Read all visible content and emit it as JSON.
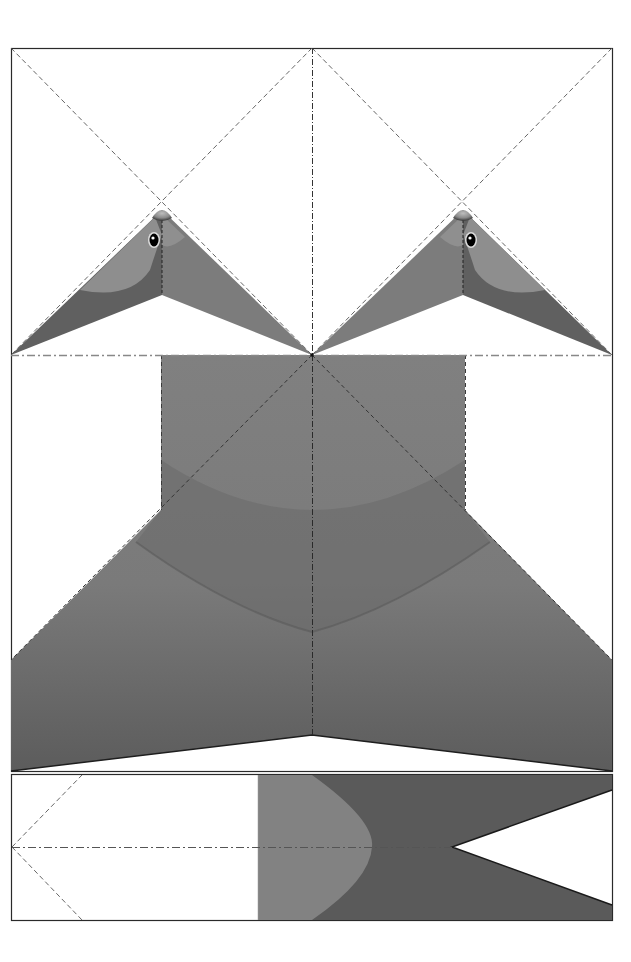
{
  "document": {
    "type": "papercraft-template",
    "subject": "bird",
    "pieces": [
      {
        "id": "head-left",
        "label": "Head (left)"
      },
      {
        "id": "head-right",
        "label": "Head (right)"
      },
      {
        "id": "body",
        "label": "Body / wings"
      },
      {
        "id": "tail",
        "label": "Tail strip"
      }
    ],
    "line_legend": {
      "cut_line": "solid",
      "valley_fold": "dashed",
      "mountain_fold": "dash-dot"
    }
  },
  "colors": {
    "paper": "#ffffff",
    "outline": "#2a2a2a",
    "fold": "#4a4a4a",
    "mid_gray": "#7e7e7e",
    "light_gray": "#9a9a9a",
    "dark_gray": "#5e5e5e",
    "darker_gray": "#555555",
    "eye": "#000000",
    "eye_ring": "#dddddd"
  },
  "watermark": ""
}
